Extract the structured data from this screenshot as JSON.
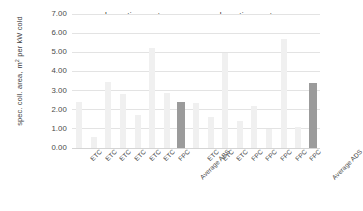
{
  "chart_data": {
    "type": "bar",
    "title": "",
    "xlabel": "",
    "ylabel": "spec. coll. area, m² per kW cold",
    "ylabel_line1": "spec. coll. area,",
    "ylabel_line2_prefix": "m",
    "ylabel_line2_sup": "2",
    "ylabel_line2_suffix": " per kW cold",
    "ylim": [
      0,
      7
    ],
    "ytick_step": 1,
    "ytick_labels": [
      "7.00",
      "6.00",
      "5.00",
      "4.00",
      "3.00",
      "2.00",
      "1.00",
      "0.00"
    ],
    "ytick_values": [
      7,
      6,
      5,
      4,
      3,
      2,
      1,
      0
    ],
    "grid": true,
    "legend": null,
    "group_labels": [
      "absorption systems",
      "adsorption systems"
    ],
    "categories": [
      "ETC",
      "ETC",
      "ETC",
      "ETC",
      "ETC",
      "ETC",
      "FPC",
      "Average ABS",
      "ETC",
      "ETC",
      "ETC",
      "FPC",
      "FPC",
      "FPC",
      "FPC",
      "FPC",
      "Average ADS"
    ],
    "values": [
      2.42,
      0.58,
      3.45,
      2.82,
      1.75,
      5.22,
      2.85,
      2.42,
      2.37,
      1.62,
      4.95,
      1.4,
      2.2,
      0.98,
      5.7,
      1.08,
      3.38
    ],
    "bar_kinds": [
      "item",
      "item",
      "item",
      "item",
      "item",
      "item",
      "item",
      "average",
      "item",
      "item",
      "item",
      "item",
      "item",
      "item",
      "item",
      "item",
      "average"
    ],
    "colors": {
      "bar_item": "#f0f0f0",
      "bar_average": "#9b9b9b",
      "grid": "#e3e3e3",
      "text": "#3c3c3c",
      "background": "#ffffff"
    }
  }
}
